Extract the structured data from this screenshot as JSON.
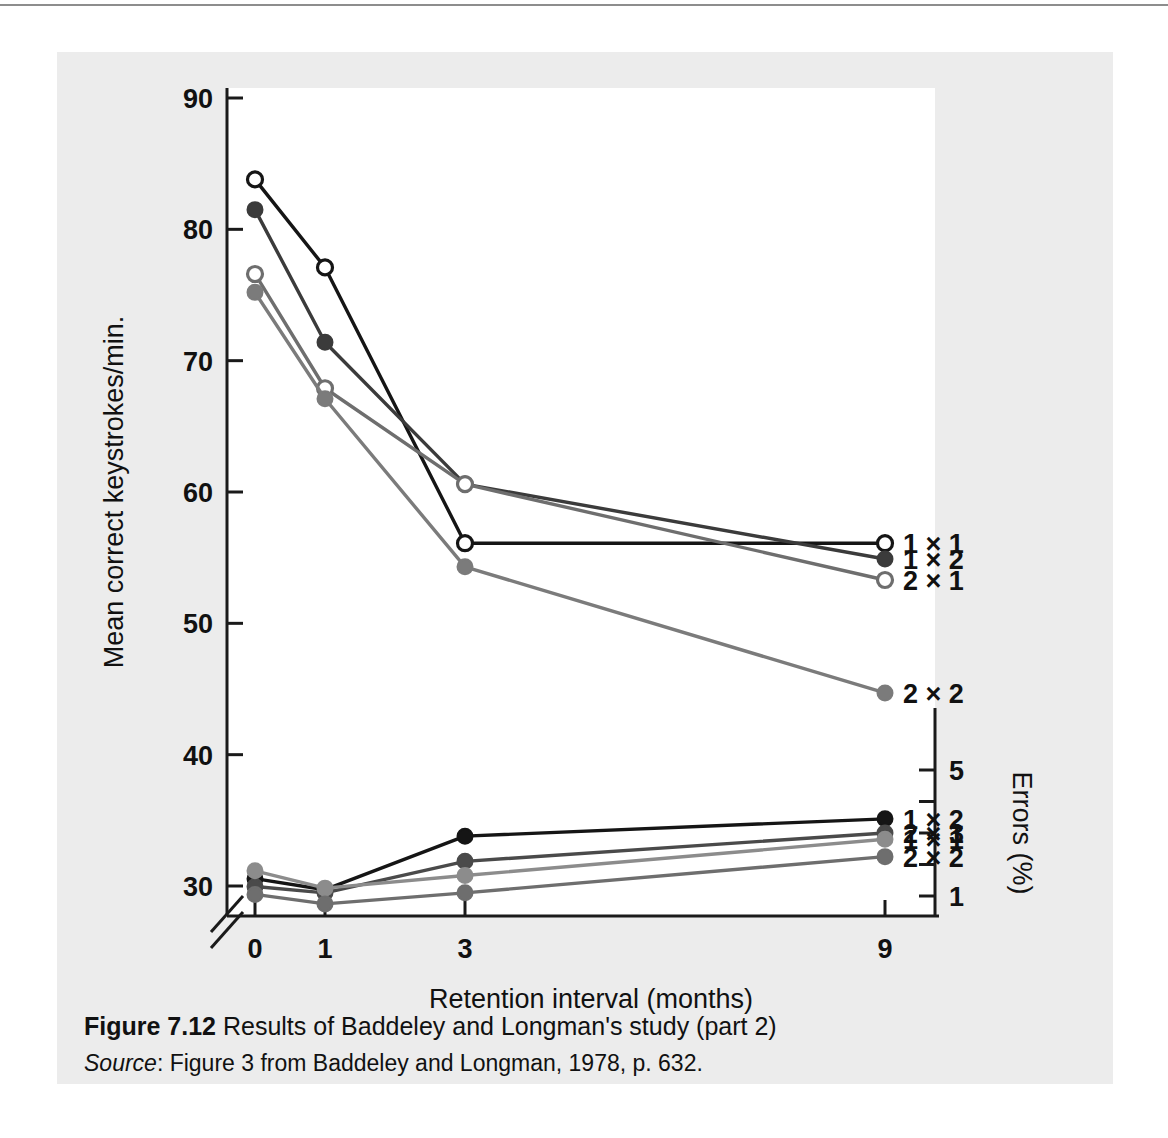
{
  "figure": {
    "caption_figure_number": "Figure 7.12",
    "caption_title": "Results of Baddeley and Longman's study (part 2)",
    "source_word": "Source",
    "source_text": ": Figure 3 from Baddeley and Longman, 1978, p. 632."
  },
  "colors": {
    "page_background": "#ffffff",
    "figure_background": "#ececec",
    "plot_background": "#ffffff",
    "axis": "#1a1a1a",
    "series_black": "#151515",
    "series_dark_gray": "#4a4a4a",
    "series_mid_gray": "#6e6e6e",
    "series_light_gray": "#8c8c8c",
    "text": "#111111",
    "top_rule": "#8d8d8d"
  },
  "chart_data": {
    "type": "line",
    "title": "Results of Baddeley and Longman's study (part 2)",
    "xlabel": "Retention interval (months)",
    "ylabel": "Mean correct keystrokes/min.",
    "y2label": "Errors (%)",
    "x": [
      0,
      1,
      3,
      9
    ],
    "xtick_labels": [
      "0",
      "1",
      "3",
      "9"
    ],
    "ytick_labels": [
      "30",
      "40",
      "50",
      "60",
      "70",
      "80",
      "90"
    ],
    "ylim": [
      30,
      90
    ],
    "y_axis_broken_below": "30",
    "y2tick_labels": [
      "1",
      "3",
      "5"
    ],
    "y2lim": [
      0.2,
      5.8
    ],
    "grid": false,
    "legend_position": "right-of-lines",
    "panels": [
      {
        "name": "keystrokes",
        "axis": "left",
        "series": [
          {
            "name": "1 × 1",
            "marker": "open-circle",
            "color": "#151515",
            "values": [
              83.8,
              77.1,
              56.1,
              56.1
            ]
          },
          {
            "name": "1 × 2",
            "marker": "filled-circle",
            "color": "#3b3b3b",
            "values": [
              81.5,
              71.4,
              60.6,
              54.9
            ]
          },
          {
            "name": "2 × 1",
            "marker": "open-circle",
            "color": "#6e6e6e",
            "values": [
              76.6,
              67.9,
              60.6,
              53.3
            ]
          },
          {
            "name": "2 × 2",
            "marker": "filled-circle",
            "color": "#7b7b7b",
            "values": [
              75.2,
              67.1,
              54.3,
              44.7
            ]
          }
        ]
      },
      {
        "name": "errors",
        "axis": "right",
        "series": [
          {
            "name": "1 × 2",
            "marker": "filled-circle",
            "color": "#151515",
            "values": [
              1.55,
              1.2,
              2.9,
              3.45
            ]
          },
          {
            "name": "2 × 1",
            "marker": "filled-circle",
            "color": "#4a4a4a",
            "values": [
              1.3,
              1.1,
              2.1,
              3.0
            ]
          },
          {
            "name": "1 × 1",
            "marker": "filled-circle",
            "color": "#8c8c8c",
            "values": [
              1.8,
              1.25,
              1.65,
              2.8
            ]
          },
          {
            "name": "2 × 2",
            "marker": "filled-circle",
            "color": "#6e6e6e",
            "values": [
              1.05,
              0.75,
              1.1,
              2.25
            ]
          }
        ]
      }
    ]
  }
}
